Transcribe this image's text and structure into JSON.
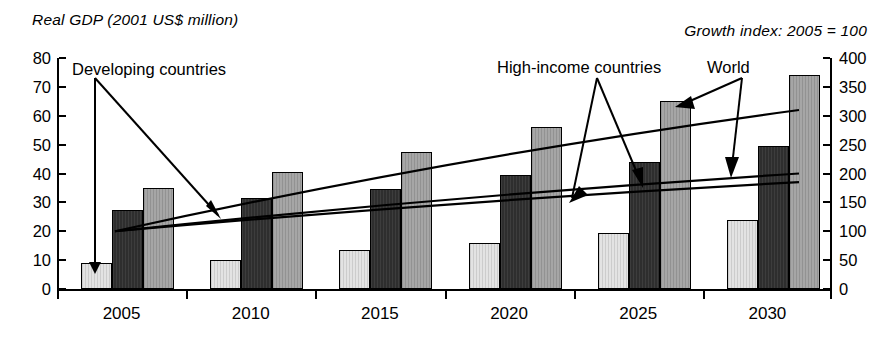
{
  "header": {
    "left_title": "Real GDP (2001 US$ million)",
    "right_title": "Growth index: 2005 = 100"
  },
  "annotations": {
    "developing": "Developing countries",
    "high_income": "High-income countries",
    "world": "World"
  },
  "chart_data": {
    "type": "bar",
    "title": "Real GDP (2001 US$ million)",
    "subtitle": "Growth index: 2005 = 100",
    "xlabel": "",
    "ylabel": "Real GDP (2001 US$ million)",
    "y2label": "Growth index: 2005 = 100",
    "categories": [
      "2005",
      "2010",
      "2015",
      "2020",
      "2025",
      "2030"
    ],
    "ylim": [
      0,
      80
    ],
    "yticks": [
      0,
      10,
      20,
      30,
      40,
      50,
      60,
      70,
      80
    ],
    "y2lim": [
      0,
      400
    ],
    "y2ticks": [
      0,
      50,
      100,
      150,
      200,
      250,
      300,
      350,
      400
    ],
    "grid": false,
    "legend": "annotated-arrows",
    "series": [
      {
        "name": "Developing countries",
        "axis": "left",
        "fill": "#e3e3e3",
        "values": [
          9,
          10,
          13.5,
          16,
          19.5,
          24
        ]
      },
      {
        "name": "High-income countries",
        "axis": "left",
        "fill": "#2e2e2e",
        "values": [
          27.5,
          31.5,
          34.5,
          39.5,
          44,
          49.5
        ]
      },
      {
        "name": "World",
        "axis": "left",
        "fill": "#a6a6a6",
        "values": [
          35,
          40.5,
          47.5,
          56,
          65,
          74
        ]
      }
    ],
    "trend_lines": [
      {
        "name": "World",
        "axis": "right",
        "start_value": 100,
        "end_value": 310
      },
      {
        "name": "High-income countries",
        "axis": "right",
        "start_value": 100,
        "end_value": 200
      },
      {
        "name": "Developing countries",
        "axis": "right",
        "start_value": 100,
        "end_value": 185
      }
    ]
  }
}
